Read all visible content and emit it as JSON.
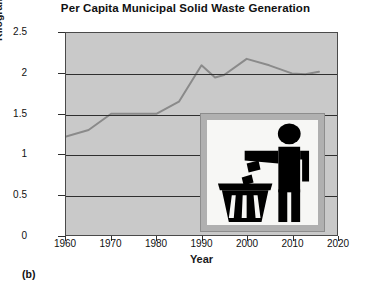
{
  "figure": {
    "panel_label": "(b)"
  },
  "chart_data": {
    "type": "line",
    "title": "Per Capita Municipal Solid Waste Generation",
    "xlabel": "Year",
    "ylabel": "Kilograms Per Person Per Day",
    "xlim": [
      1960,
      2020
    ],
    "ylim": [
      0,
      2.5
    ],
    "grid": true,
    "legend": "none",
    "plot_background": "#c9c9c9",
    "line_color": "#8a8a8a",
    "xticks": [
      1960,
      1970,
      1980,
      1990,
      2000,
      2010,
      2020
    ],
    "xtick_labels": [
      "1960",
      "1970",
      "1980",
      "1990",
      "2000",
      "2010",
      "2020"
    ],
    "yticks": [
      0,
      0.5,
      1,
      1.5,
      2,
      2.5
    ],
    "ytick_labels": [
      "0",
      "0.5",
      "1",
      "1.5",
      "2",
      "2.5"
    ],
    "x": [
      1960,
      1965,
      1970,
      1975,
      1980,
      1985,
      1990,
      1993,
      1995,
      2000,
      2005,
      2010,
      2013,
      2016
    ],
    "values": [
      1.22,
      1.3,
      1.5,
      1.5,
      1.5,
      1.65,
      2.1,
      1.95,
      1.98,
      2.18,
      2.1,
      2.0,
      1.99,
      2.02
    ],
    "annotation": {
      "name": "waste-pictogram",
      "description": "Pictogram of a person dropping litter into a waste bin"
    }
  }
}
